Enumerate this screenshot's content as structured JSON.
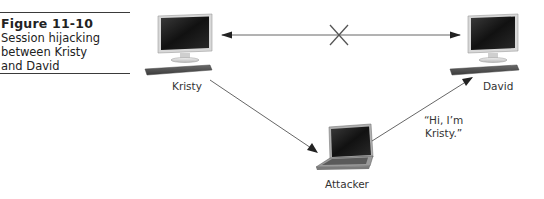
{
  "figure": {
    "number": "Figure 11-10",
    "caption_lines": [
      "Session hijacking",
      "between Kristy",
      "and David"
    ]
  },
  "nodes": {
    "kristy": {
      "label": "Kristy",
      "device": "desktop-computer"
    },
    "david": {
      "label": "David",
      "device": "desktop-computer"
    },
    "attacker": {
      "label": "Attacker",
      "device": "laptop"
    }
  },
  "edges": [
    {
      "from": "kristy",
      "to": "david",
      "style": "double-arrow",
      "blocked": true,
      "marker": "x-icon"
    },
    {
      "from": "kristy",
      "to": "attacker",
      "style": "arrow"
    },
    {
      "from": "attacker",
      "to": "david",
      "style": "arrow",
      "annotation": "“Hi, I’m Kristy.”"
    }
  ],
  "annotation_lines": [
    "“Hi, I’m",
    "Kristy.”"
  ],
  "colors": {
    "line": "#555555",
    "text": "#222222",
    "rule": "#3a3a3a",
    "screen": "#1c1c1c"
  }
}
